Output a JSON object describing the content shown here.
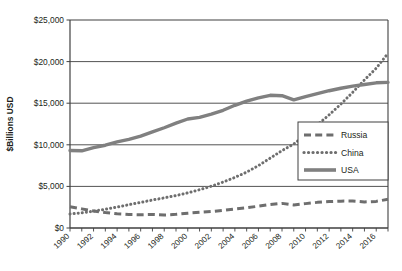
{
  "chart_data": {
    "type": "line",
    "title": "",
    "xlabel": "",
    "ylabel": "$Billions USD",
    "xlim": [
      1990,
      2017
    ],
    "ylim": [
      0,
      25000
    ],
    "grid": true,
    "legend_position": "right-middle",
    "y_ticks": [
      "$0",
      "$5,000",
      "$10,000",
      "$15,000",
      "$20,000",
      "$25,000"
    ],
    "y_tick_values": [
      0,
      5000,
      10000,
      15000,
      20000,
      25000
    ],
    "x_ticks": [
      "1990",
      "1992",
      "1994",
      "1996",
      "1998",
      "2000",
      "2002",
      "2004",
      "2006",
      "2008",
      "2010",
      "2012",
      "2014",
      "2016"
    ],
    "x": [
      1990,
      1991,
      1992,
      1993,
      1994,
      1995,
      1996,
      1997,
      1998,
      1999,
      2000,
      2001,
      2002,
      2003,
      2004,
      2005,
      2006,
      2007,
      2008,
      2009,
      2010,
      2011,
      2012,
      2013,
      2014,
      2015,
      2016,
      2017
    ],
    "series": [
      {
        "name": "Russia",
        "style": "dashed",
        "color": "#6e6e6e",
        "values": [
          2550,
          2300,
          2050,
          1850,
          1700,
          1620,
          1600,
          1620,
          1560,
          1640,
          1780,
          1880,
          1980,
          2120,
          2280,
          2430,
          2620,
          2820,
          2960,
          2770,
          2930,
          3080,
          3180,
          3230,
          3240,
          3130,
          3200,
          3450
        ]
      },
      {
        "name": "China",
        "style": "dotted",
        "color": "#6e6e6e",
        "values": [
          1680,
          1830,
          2020,
          2260,
          2520,
          2800,
          3080,
          3360,
          3620,
          3900,
          4220,
          4600,
          5020,
          5520,
          6080,
          6720,
          7500,
          8400,
          9300,
          10100,
          11200,
          12400,
          13600,
          14900,
          16300,
          17800,
          19200,
          21000
        ]
      },
      {
        "name": "USA",
        "style": "solid",
        "color": "#808080",
        "values": [
          9320,
          9280,
          9650,
          9950,
          10350,
          10650,
          11050,
          11550,
          12050,
          12600,
          13100,
          13300,
          13700,
          14150,
          14750,
          15250,
          15650,
          15950,
          15900,
          15400,
          15800,
          16150,
          16500,
          16800,
          17050,
          17250,
          17450,
          17500
        ]
      }
    ]
  },
  "legend": {
    "items": [
      {
        "label": "Russia",
        "style": "dashed"
      },
      {
        "label": "China",
        "style": "dotted"
      },
      {
        "label": "USA",
        "style": "solid"
      }
    ]
  }
}
